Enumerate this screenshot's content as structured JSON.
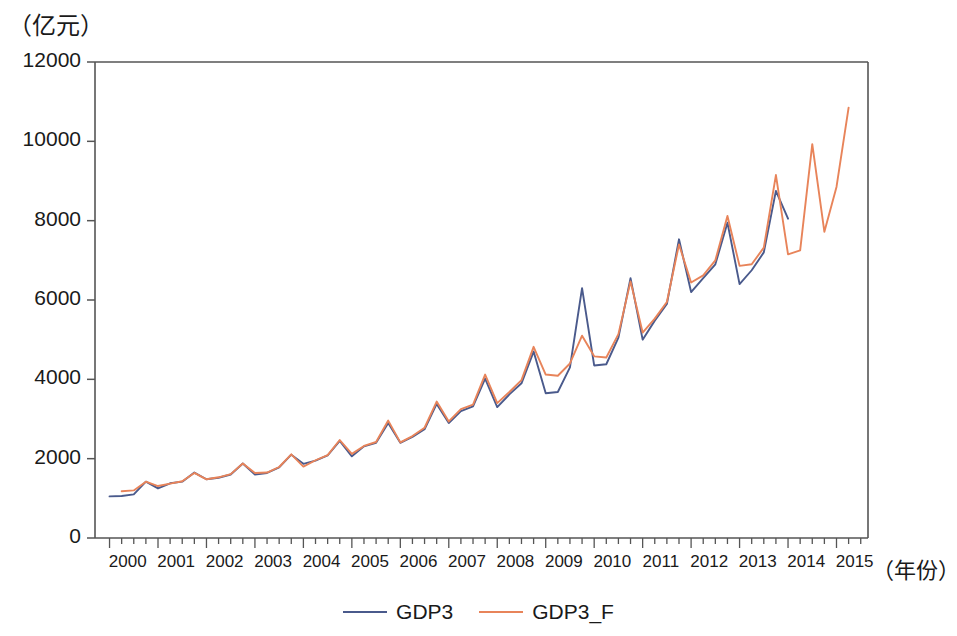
{
  "chart_data": {
    "type": "line",
    "title": "",
    "ylabel": "（亿元）",
    "xlabel": "（年份）",
    "ylim": [
      0,
      12000
    ],
    "yticks": [
      0,
      2000,
      4000,
      6000,
      8000,
      10000,
      12000
    ],
    "ytick_labels": [
      "0",
      "2000",
      "4000",
      "6000",
      "8000",
      "10000",
      "12000"
    ],
    "xtick_labels": [
      "2000",
      "2001",
      "2002",
      "2003",
      "2004",
      "2005",
      "2006",
      "2007",
      "2008",
      "2009",
      "2010",
      "2011",
      "2012",
      "2013",
      "2014",
      "2015"
    ],
    "x_minor_ticks_per_year": 4,
    "xlim": [
      "1999Q4",
      "2015Q3"
    ],
    "grid": false,
    "legend_position": "bottom-center",
    "colors": {
      "gdp3": "#4a5a8c",
      "gdp3_f": "#e8845a",
      "axis": "#555555",
      "text": "#1a1a1a"
    },
    "x": [
      "2000Q1",
      "2000Q2",
      "2000Q3",
      "2000Q4",
      "2001Q1",
      "2001Q2",
      "2001Q3",
      "2001Q4",
      "2002Q1",
      "2002Q2",
      "2002Q3",
      "2002Q4",
      "2003Q1",
      "2003Q2",
      "2003Q3",
      "2003Q4",
      "2004Q1",
      "2004Q2",
      "2004Q3",
      "2004Q4",
      "2005Q1",
      "2005Q2",
      "2005Q3",
      "2005Q4",
      "2006Q1",
      "2006Q2",
      "2006Q3",
      "2006Q4",
      "2007Q1",
      "2007Q2",
      "2007Q3",
      "2007Q4",
      "2008Q1",
      "2008Q2",
      "2008Q3",
      "2008Q4",
      "2009Q1",
      "2009Q2",
      "2009Q3",
      "2009Q4",
      "2010Q1",
      "2010Q2",
      "2010Q3",
      "2010Q4",
      "2011Q1",
      "2011Q2",
      "2011Q3",
      "2011Q4",
      "2012Q1",
      "2012Q2",
      "2012Q3",
      "2012Q4",
      "2013Q1",
      "2013Q2",
      "2013Q3",
      "2013Q4",
      "2014Q1",
      "2014Q2",
      "2014Q3",
      "2014Q4",
      "2015Q1",
      "2015Q2"
    ],
    "series": [
      {
        "name": "GDP3",
        "color": "#4a5a8c",
        "values": [
          1050,
          1060,
          1100,
          1420,
          1250,
          1380,
          1420,
          1650,
          1480,
          1520,
          1600,
          1880,
          1600,
          1640,
          1780,
          2100,
          1870,
          1950,
          2080,
          2450,
          2060,
          2310,
          2400,
          2900,
          2400,
          2550,
          2740,
          3380,
          2900,
          3200,
          3320,
          4020,
          3300,
          3620,
          3900,
          4700,
          3650,
          3680,
          4300,
          6300,
          4350,
          4380,
          5050,
          6550,
          5000,
          5480,
          5900,
          7530,
          6200,
          6550,
          6900,
          7950,
          6400,
          6750,
          7200,
          8750,
          8050,
          null,
          null,
          null,
          null,
          null
        ]
      },
      {
        "name": "GDP3_F",
        "color": "#e8845a",
        "values": [
          null,
          1180,
          1200,
          1420,
          1310,
          1370,
          1430,
          1640,
          1480,
          1530,
          1610,
          1880,
          1640,
          1650,
          1790,
          2110,
          1800,
          1960,
          2090,
          2470,
          2120,
          2320,
          2420,
          2960,
          2410,
          2570,
          2780,
          3440,
          2940,
          3250,
          3360,
          4120,
          3400,
          3680,
          3980,
          4820,
          4120,
          4090,
          4400,
          5100,
          4580,
          4550,
          5140,
          6470,
          5180,
          5530,
          5950,
          7400,
          6440,
          6620,
          7000,
          8120,
          6860,
          6900,
          7320,
          9150,
          7150,
          7250,
          9930,
          7720,
          8850,
          10850
        ]
      }
    ]
  }
}
